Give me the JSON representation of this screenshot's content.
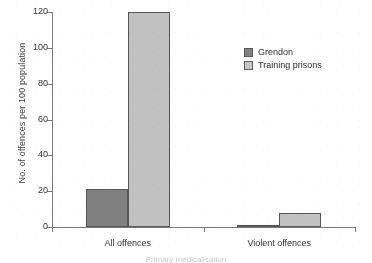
{
  "chart_data": {
    "type": "bar",
    "title": "",
    "subtitle": "",
    "xlabel": "",
    "ylabel": "No. of offences per 100 population",
    "categories": [
      "All offences",
      "Violent offences"
    ],
    "series": [
      {
        "name": "Grendon",
        "color": "#808080",
        "values": [
          21,
          1
        ]
      },
      {
        "name": "Training prisons",
        "color": "#c3c3c3",
        "values": [
          120,
          8
        ]
      }
    ],
    "ylim": [
      0,
      120
    ],
    "yticks": [
      0,
      20,
      40,
      60,
      80,
      100,
      120
    ],
    "ytick_labels": [
      "0",
      "20",
      "40",
      "60",
      "80",
      "100",
      "120"
    ],
    "grid": false,
    "legend_position": "top-right",
    "annotations": []
  },
  "axes": {
    "y_title": "No. of offences per 100 population",
    "x_tick_labels": [
      "All offences",
      "Violent offences"
    ]
  },
  "legend": {
    "entries": [
      {
        "label": "Grendon",
        "swatch": "#808080"
      },
      {
        "label": "Training prisons",
        "swatch": "#c9c9c9"
      }
    ]
  },
  "footer": {
    "cutoff_caption": "Primary medicalisation"
  }
}
